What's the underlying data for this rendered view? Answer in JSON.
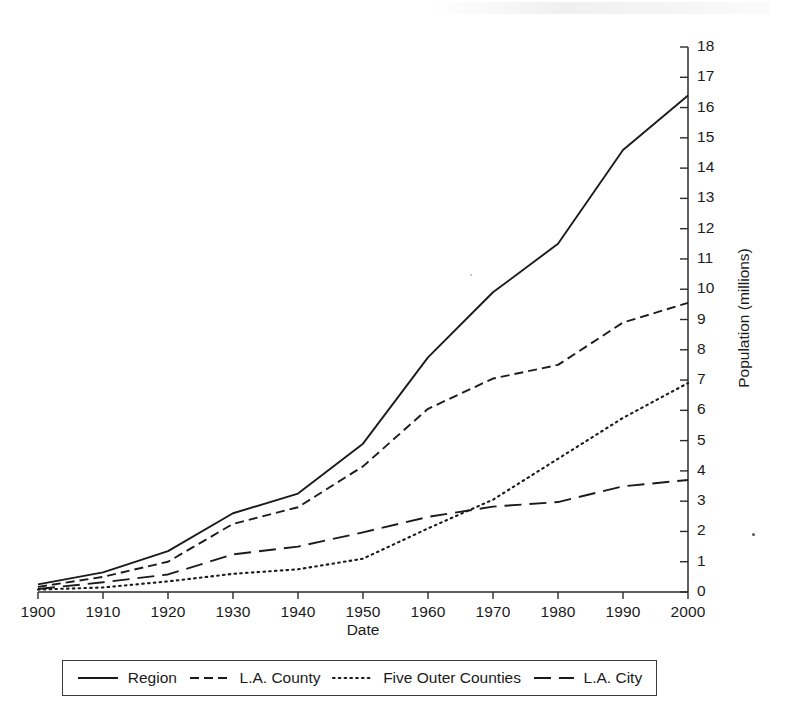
{
  "chart_data": {
    "type": "line",
    "title": "",
    "xlabel": "Date",
    "ylabel": "Population (millions)",
    "xlim": [
      1900,
      2000
    ],
    "ylim": [
      0,
      18
    ],
    "grid": false,
    "legend_position": "below-plot",
    "x": [
      1900,
      1910,
      1920,
      1930,
      1940,
      1950,
      1960,
      1970,
      1980,
      1990,
      2000
    ],
    "xticks": [
      "1900",
      "1910",
      "1920",
      "1930",
      "1940",
      "1950",
      "1960",
      "1970",
      "1980",
      "1990",
      "2000"
    ],
    "yticks": [
      "0",
      "1",
      "2",
      "3",
      "4",
      "5",
      "6",
      "7",
      "8",
      "9",
      "10",
      "11",
      "12",
      "13",
      "14",
      "15",
      "16",
      "17",
      "18"
    ],
    "series": [
      {
        "name": "Region",
        "style": "solid",
        "values": [
          0.25,
          0.65,
          1.35,
          2.6,
          3.25,
          4.9,
          7.75,
          9.9,
          11.5,
          14.6,
          16.4
        ]
      },
      {
        "name": "L.A. County",
        "style": "dashed",
        "values": [
          0.17,
          0.5,
          1.0,
          2.25,
          2.8,
          4.15,
          6.05,
          7.05,
          7.5,
          8.9,
          9.55
        ]
      },
      {
        "name": "Five Outer Counties",
        "style": "dotted",
        "values": [
          0.08,
          0.15,
          0.35,
          0.6,
          0.75,
          1.1,
          2.1,
          3.05,
          4.4,
          5.75,
          6.9
        ]
      },
      {
        "name": "L.A. City",
        "style": "long-dash",
        "values": [
          0.1,
          0.32,
          0.58,
          1.24,
          1.5,
          1.97,
          2.48,
          2.82,
          2.97,
          3.49,
          3.7
        ]
      }
    ]
  },
  "legend": {
    "entries": [
      {
        "label": "Region"
      },
      {
        "label": "L.A. County"
      },
      {
        "label": "Five Outer Counties"
      },
      {
        "label": "L.A. City"
      }
    ]
  }
}
